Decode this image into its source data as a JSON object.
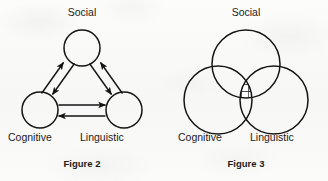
{
  "page": {
    "background_color": "#fcfcfb",
    "ink_color": "#1b1b1b"
  },
  "figures": [
    {
      "id": "figure-2",
      "caption": "Figure 2",
      "type": "triangle-node-diagram",
      "top_label": "Social",
      "bottom_left_label": "Cognitive",
      "bottom_right_label": "Linguistic",
      "nodes": [
        {
          "name": "Social",
          "cx": 82,
          "cy": 48,
          "r": 18
        },
        {
          "name": "Cognitive",
          "cx": 40,
          "cy": 110,
          "r": 18
        },
        {
          "name": "Linguistic",
          "cx": 124,
          "cy": 110,
          "r": 18
        }
      ],
      "arrows": [
        {
          "from": "Cognitive",
          "to": "Social"
        },
        {
          "from": "Social",
          "to": "Cognitive"
        },
        {
          "from": "Linguistic",
          "to": "Social"
        },
        {
          "from": "Social",
          "to": "Linguistic"
        },
        {
          "from": "Cognitive",
          "to": "Linguistic"
        },
        {
          "from": "Linguistic",
          "to": "Cognitive"
        }
      ]
    },
    {
      "id": "figure-3",
      "caption": "Figure 3",
      "type": "venn-diagram",
      "top_label": "Social",
      "bottom_left_label": "Cognitive",
      "bottom_right_label": "Linguistic",
      "circles": [
        {
          "name": "Social",
          "cx": 82,
          "cy": 64,
          "r": 34
        },
        {
          "name": "Cognitive",
          "cx": 54,
          "cy": 100,
          "r": 34
        },
        {
          "name": "Linguistic",
          "cx": 110,
          "cy": 100,
          "r": 34
        }
      ],
      "hatched_region": "triple-intersection",
      "hatch_pattern": "cross-hatch-grid"
    }
  ]
}
